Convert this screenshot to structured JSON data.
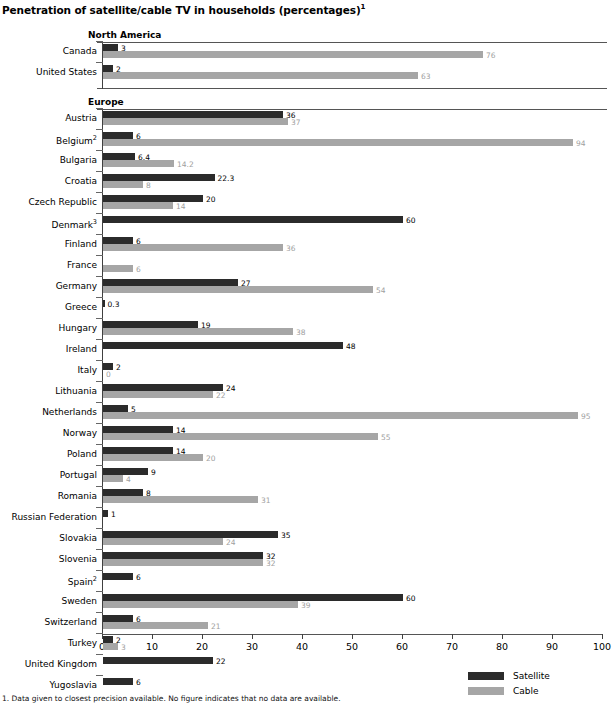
{
  "title": "Penetration of satellite/cable TV in households (percentages)",
  "title_superscript": "1",
  "footnote": "1. Data given to closest precision available. No figure indicates that no data are available.",
  "legend": {
    "position": "bottom-right",
    "items": [
      {
        "label": "Satellite",
        "color": "#2b2b2b",
        "key": "satellite"
      },
      {
        "label": "Cable",
        "color": "#a6a6a6",
        "key": "cable"
      }
    ]
  },
  "axis": {
    "xlabel": "",
    "ylabel": "",
    "xlim": [
      0,
      100
    ],
    "xticks": [
      0,
      10,
      20,
      30,
      40,
      50,
      60,
      70,
      80,
      90,
      100
    ],
    "xtick_labels": [
      "0",
      "10",
      "20",
      "30",
      "40",
      "50",
      "60",
      "70",
      "80",
      "90",
      "100"
    ],
    "grid": false
  },
  "regions": [
    {
      "name": "North America",
      "label": "North America"
    },
    {
      "name": "Europe",
      "label": "Europe"
    }
  ],
  "chart_data": {
    "type": "bar",
    "orientation": "horizontal",
    "title": "Penetration of satellite/cable TV in households (percentages)",
    "xlabel": "",
    "ylabel": "",
    "xlim": [
      0,
      100
    ],
    "xticks": [
      0,
      10,
      20,
      30,
      40,
      50,
      60,
      70,
      80,
      90,
      100
    ],
    "grid": false,
    "legend": [
      "Satellite",
      "Cable"
    ],
    "legend_position": "bottom-right",
    "groups": [
      {
        "region": "North America",
        "categories": [
          "Canada",
          "United States"
        ],
        "series": [
          {
            "name": "Satellite",
            "color": "#2b2b2b",
            "values": [
              3,
              2
            ]
          },
          {
            "name": "Cable",
            "color": "#a6a6a6",
            "values": [
              76,
              63
            ]
          }
        ]
      },
      {
        "region": "Europe",
        "categories": [
          "Austria",
          "Belgium",
          "Bulgaria",
          "Croatia",
          "Czech Republic",
          "Denmark",
          "Finland",
          "France",
          "Germany",
          "Greece",
          "Hungary",
          "Ireland",
          "Italy",
          "Lithuania",
          "Netherlands",
          "Norway",
          "Poland",
          "Portugal",
          "Romania",
          "Russian Federation",
          "Slovakia",
          "Slovenia",
          "Spain",
          "Sweden",
          "Switzerland",
          "Turkey",
          "United Kingdom",
          "Yugoslavia"
        ],
        "series": [
          {
            "name": "Satellite",
            "color": "#2b2b2b",
            "values": [
              36,
              6,
              6.4,
              22.3,
              20,
              60,
              6,
              null,
              27,
              0.3,
              19,
              48,
              2,
              24,
              5,
              14,
              14,
              9,
              8,
              1,
              35,
              32,
              6,
              60,
              6,
              2,
              22,
              6
            ]
          },
          {
            "name": "Cable",
            "color": "#a6a6a6",
            "values": [
              37,
              94,
              14.2,
              8,
              14,
              null,
              36,
              6,
              54,
              null,
              38,
              null,
              0,
              22,
              95,
              55,
              20,
              4,
              31,
              null,
              24,
              32,
              null,
              39,
              21,
              3,
              null,
              null
            ]
          }
        ]
      }
    ]
  },
  "rows": [
    {
      "region": "north-america",
      "label": "Canada",
      "sup": "",
      "satellite": 3,
      "satellite_label": "3",
      "cable": 76,
      "cable_label": "76"
    },
    {
      "region": "north-america",
      "label": "United States",
      "sup": "",
      "satellite": 2,
      "satellite_label": "2",
      "cable": 63,
      "cable_label": "63"
    },
    {
      "region": "europe",
      "label": "Austria",
      "sup": "",
      "satellite": 36,
      "satellite_label": "36",
      "cable": 37,
      "cable_label": "37"
    },
    {
      "region": "europe",
      "label": "Belgium",
      "sup": "2",
      "satellite": 6,
      "satellite_label": "6",
      "cable": 94,
      "cable_label": "94"
    },
    {
      "region": "europe",
      "label": "Bulgaria",
      "sup": "",
      "satellite": 6.4,
      "satellite_label": "6.4",
      "cable": 14.2,
      "cable_label": "14.2"
    },
    {
      "region": "europe",
      "label": "Croatia",
      "sup": "",
      "satellite": 22.3,
      "satellite_label": "22.3",
      "cable": 8,
      "cable_label": "8"
    },
    {
      "region": "europe",
      "label": "Czech Republic",
      "sup": "",
      "satellite": 20,
      "satellite_label": "20",
      "cable": 14,
      "cable_label": "14"
    },
    {
      "region": "europe",
      "label": "Denmark",
      "sup": "3",
      "satellite": 60,
      "satellite_label": "60",
      "cable": null,
      "cable_label": ""
    },
    {
      "region": "europe",
      "label": "Finland",
      "sup": "",
      "satellite": 6,
      "satellite_label": "6",
      "cable": 36,
      "cable_label": "36"
    },
    {
      "region": "europe",
      "label": "France",
      "sup": "",
      "satellite": null,
      "satellite_label": "",
      "cable": 6,
      "cable_label": "6"
    },
    {
      "region": "europe",
      "label": "Germany",
      "sup": "",
      "satellite": 27,
      "satellite_label": "27",
      "cable": 54,
      "cable_label": "54"
    },
    {
      "region": "europe",
      "label": "Greece",
      "sup": "",
      "satellite": 0.3,
      "satellite_label": "0.3",
      "cable": null,
      "cable_label": ""
    },
    {
      "region": "europe",
      "label": "Hungary",
      "sup": "",
      "satellite": 19,
      "satellite_label": "19",
      "cable": 38,
      "cable_label": "38"
    },
    {
      "region": "europe",
      "label": "Ireland",
      "sup": "",
      "satellite": 48,
      "satellite_label": "48",
      "cable": null,
      "cable_label": ""
    },
    {
      "region": "europe",
      "label": "Italy",
      "sup": "",
      "satellite": 2,
      "satellite_label": "2",
      "cable": 0,
      "cable_label": "0"
    },
    {
      "region": "europe",
      "label": "Lithuania",
      "sup": "",
      "satellite": 24,
      "satellite_label": "24",
      "cable": 22,
      "cable_label": "22"
    },
    {
      "region": "europe",
      "label": "Netherlands",
      "sup": "",
      "satellite": 5,
      "satellite_label": "5",
      "cable": 95,
      "cable_label": "95"
    },
    {
      "region": "europe",
      "label": "Norway",
      "sup": "",
      "satellite": 14,
      "satellite_label": "14",
      "cable": 55,
      "cable_label": "55"
    },
    {
      "region": "europe",
      "label": "Poland",
      "sup": "",
      "satellite": 14,
      "satellite_label": "14",
      "cable": 20,
      "cable_label": "20"
    },
    {
      "region": "europe",
      "label": "Portugal",
      "sup": "",
      "satellite": 9,
      "satellite_label": "9",
      "cable": 4,
      "cable_label": "4"
    },
    {
      "region": "europe",
      "label": "Romania",
      "sup": "",
      "satellite": 8,
      "satellite_label": "8",
      "cable": 31,
      "cable_label": "31"
    },
    {
      "region": "europe",
      "label": "Russian Federation",
      "sup": "",
      "satellite": 1,
      "satellite_label": "1",
      "cable": null,
      "cable_label": ""
    },
    {
      "region": "europe",
      "label": "Slovakia",
      "sup": "",
      "satellite": 35,
      "satellite_label": "35",
      "cable": 24,
      "cable_label": "24"
    },
    {
      "region": "europe",
      "label": "Slovenia",
      "sup": "",
      "satellite": 32,
      "satellite_label": "32",
      "cable": 32,
      "cable_label": "32"
    },
    {
      "region": "europe",
      "label": "Spain",
      "sup": "2",
      "satellite": 6,
      "satellite_label": "6",
      "cable": null,
      "cable_label": ""
    },
    {
      "region": "europe",
      "label": "Sweden",
      "sup": "",
      "satellite": 60,
      "satellite_label": "60",
      "cable": 39,
      "cable_label": "39"
    },
    {
      "region": "europe",
      "label": "Switzerland",
      "sup": "",
      "satellite": 6,
      "satellite_label": "6",
      "cable": 21,
      "cable_label": "21"
    },
    {
      "region": "europe",
      "label": "Turkey",
      "sup": "",
      "satellite": 2,
      "satellite_label": "2",
      "cable": 3,
      "cable_label": "3"
    },
    {
      "region": "europe",
      "label": "United Kingdom",
      "sup": "",
      "satellite": 22,
      "satellite_label": "22",
      "cable": null,
      "cable_label": ""
    },
    {
      "region": "europe",
      "label": "Yugoslavia",
      "sup": "",
      "satellite": 6,
      "satellite_label": "6",
      "cable": null,
      "cable_label": ""
    }
  ]
}
